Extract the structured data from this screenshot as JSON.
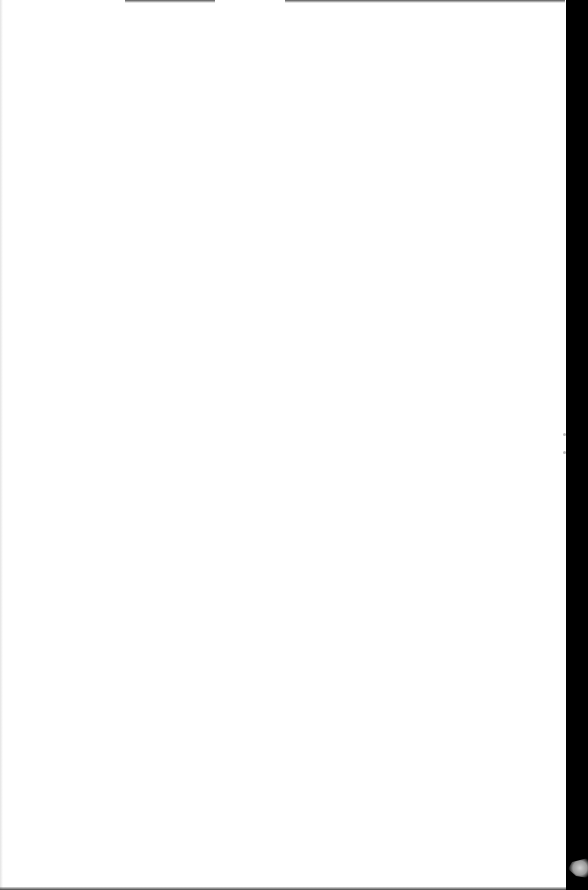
{
  "document": {
    "type": "scanned-page",
    "content": "",
    "is_blank": true
  },
  "colors": {
    "paper": "#ffffff",
    "scan_background": "#000000"
  }
}
